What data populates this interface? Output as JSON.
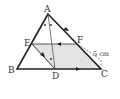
{
  "figure": {
    "type": "triangle-geometry",
    "points": {
      "A": {
        "label": "A",
        "x": 48,
        "y": 14
      },
      "B": {
        "label": "B",
        "x": 17,
        "y": 69
      },
      "C": {
        "label": "C",
        "x": 101,
        "y": 69
      },
      "D": {
        "label": "D",
        "x": 55,
        "y": 69
      },
      "E": {
        "label": "E",
        "x": 32,
        "y": 44
      },
      "F": {
        "label": "F",
        "x": 78,
        "y": 44
      }
    },
    "measurement": "5 cm",
    "colors": {
      "stroke": "#222222",
      "shade": "#e3e3e3",
      "dash": "#666666"
    }
  }
}
